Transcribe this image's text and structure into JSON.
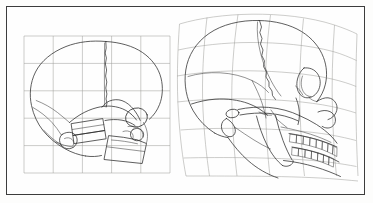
{
  "figure": {
    "domain": "scientific-illustration",
    "frame": {
      "border_color": "#3c3c3c",
      "background_color": "#fefefe",
      "page_background": "#fdfdfc"
    },
    "colors": {
      "grid_stroke": "#9a9a96",
      "outline_stroke": "#2a2a2a",
      "detail_stroke": "#3a3a3a"
    },
    "panels": [
      {
        "id": "left",
        "name": "infant-skull-panel",
        "label": "",
        "subject": "infant skull, lateral view",
        "grid_type": "regular",
        "grid_columns": 5,
        "grid_rows": 5,
        "grid_bounds": {
          "x": 24,
          "y": 36,
          "width": 146,
          "height": 137
        }
      },
      {
        "id": "right",
        "name": "adult-skull-panel",
        "label": "",
        "subject": "adult skull, lateral view",
        "grid_type": "deformed",
        "grid_columns": 5,
        "grid_rows": 5,
        "grid_bounds": {
          "x": 176,
          "y": 14,
          "width": 184,
          "height": 175
        }
      }
    ],
    "annotations": [],
    "caption": ""
  }
}
